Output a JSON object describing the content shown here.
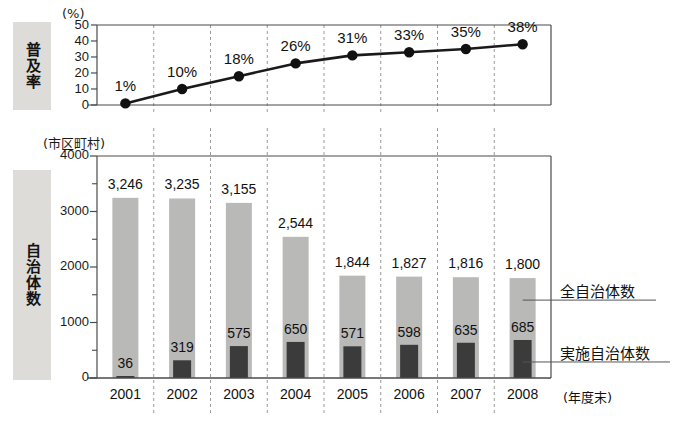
{
  "figure": {
    "top_axis_caption": "(%)",
    "bottom_axis_caption": "(市区町村)",
    "xaxis_suffix": "(年度末)",
    "side_label_rate": "普及率",
    "side_label_count": "自治体数"
  },
  "legend": {
    "total_label": "全自治体数",
    "implementing_label": "実施自治体数"
  },
  "colors": {
    "total_bar": "#b9b9b7",
    "implementing_bar": "#3b3b3b",
    "line": "#1a1a1a",
    "marker": "#111111",
    "frame": "#4a4a4a",
    "gridline": "#9a9a9a",
    "side_label_bg": "#dddcd8"
  },
  "chart_data": [
    {
      "type": "line",
      "title": "普及率",
      "xlabel": "",
      "ylabel": "(%)",
      "categories": [
        "2001",
        "2002",
        "2003",
        "2004",
        "2005",
        "2006",
        "2007",
        "2008"
      ],
      "values": [
        1,
        10,
        18,
        26,
        31,
        33,
        35,
        38
      ],
      "point_labels": [
        "1%",
        "10%",
        "18%",
        "26%",
        "31%",
        "33%",
        "35%",
        "38%"
      ],
      "ylim": [
        0,
        50
      ],
      "yticks": [
        0,
        10,
        20,
        30,
        40,
        50
      ],
      "ytick_labels": [
        "0",
        "10",
        "20",
        "30",
        "40",
        "50"
      ],
      "grid": true,
      "legend": "none"
    },
    {
      "type": "bar",
      "title": "自治体数",
      "xlabel": "(年度末)",
      "ylabel": "(市区町村)",
      "categories": [
        "2001",
        "2002",
        "2003",
        "2004",
        "2005",
        "2006",
        "2007",
        "2008"
      ],
      "series": [
        {
          "name": "全自治体数",
          "values": [
            3246,
            3235,
            3155,
            2544,
            1844,
            1827,
            1816,
            1800
          ],
          "labels": [
            "3,246",
            "3,235",
            "3,155",
            "2,544",
            "1,844",
            "1,827",
            "1,816",
            "1,800"
          ]
        },
        {
          "name": "実施自治体数",
          "values": [
            36,
            319,
            575,
            650,
            571,
            598,
            635,
            685
          ],
          "labels": [
            "36",
            "319",
            "575",
            "650",
            "571",
            "598",
            "635",
            "685"
          ]
        }
      ],
      "ylim": [
        0,
        4000
      ],
      "yticks": [
        0,
        1000,
        2000,
        3000,
        4000
      ],
      "ytick_labels": [
        "0",
        "1000",
        "2000",
        "3000",
        "4000"
      ],
      "grid": true,
      "legend": "right-callout"
    }
  ]
}
